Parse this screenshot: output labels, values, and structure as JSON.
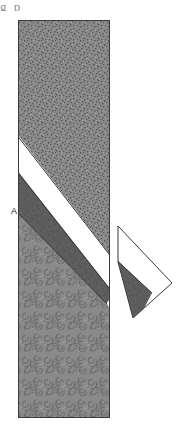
{
  "figure": {
    "title_fragment": "g            p",
    "label_a": "A",
    "canvas": {
      "width": 182,
      "height": 444,
      "background": "#ffffff"
    }
  },
  "palette": {
    "outline": "#3a3a3a",
    "upper_unit_fill": "#8a8a8a",
    "lower_unit_fill": "#8a8a8a",
    "dark_band_fill": "#5d5d5d",
    "white_band_fill": "#ffffff",
    "speckle_dark": "#5e5e5e",
    "swirl_line": "#707070",
    "label_color": "#1a1a1a"
  },
  "main_block": {
    "name": "outcrop-block",
    "x": 18,
    "y": 20,
    "width": 92,
    "height": 398,
    "units": [
      {
        "id": "upper-unit",
        "name": "upper-speckled-unit",
        "texture": "speckled",
        "fill": "#8a8a8a",
        "points": "18,20 110,20 110,255 18,135"
      },
      {
        "id": "white-band",
        "name": "white-marker-bed",
        "texture": "none",
        "fill": "#ffffff",
        "points": "18,135 110,255 110,290 18,170"
      },
      {
        "id": "dark-band",
        "name": "dark-marker-bed",
        "texture": "solid-dark",
        "fill": "#5d5d5d",
        "points": "18,170 110,290 110,293 106,303 18,212"
      },
      {
        "id": "lower-unit",
        "name": "lower-swirled-unit",
        "texture": "swirled",
        "fill": "#8a8a8a",
        "points": "18,212 106,303 110,310 110,418 18,418"
      }
    ]
  },
  "inset_shape": {
    "name": "detached-wedge",
    "vertices": "118,226 172,283 133,318 118,262",
    "parts": [
      {
        "id": "wedge-white",
        "name": "wedge-white-part",
        "fill": "#ffffff",
        "points": "118,226 172,283 150,292 118,262"
      },
      {
        "id": "wedge-dark",
        "name": "wedge-dark-part",
        "fill": "#5d5d5d",
        "points": "118,262 150,292 133,318 118,291"
      }
    ]
  },
  "annotations": [
    {
      "id": "label-a",
      "name": "label-a",
      "text": "A",
      "x": 11,
      "y": 214
    }
  ]
}
